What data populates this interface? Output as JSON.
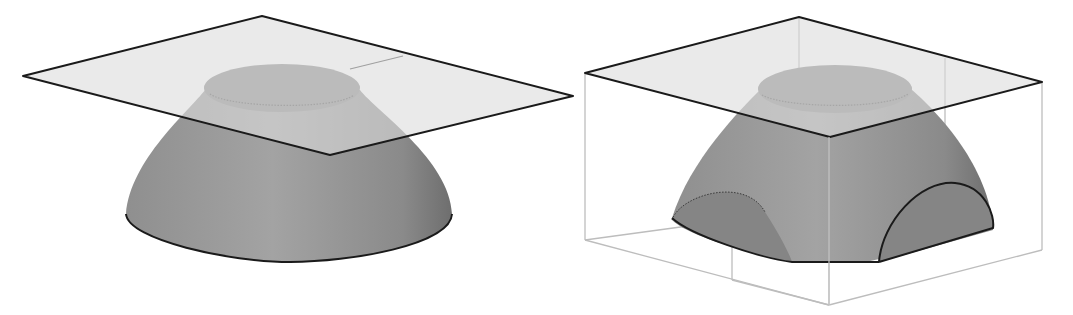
{
  "figure": {
    "panels": [
      {
        "id": "left",
        "subject": "Truncated dome with flat top cut by a translucent horizontal plane"
      },
      {
        "id": "right",
        "subject": "Truncated dome inside a bounding box, cut by a horizontal plane, with two semicircular side cuts"
      }
    ],
    "colors": {
      "background": "#ffffff",
      "solid_fill": "#9a9a9a",
      "solid_dark": "#7e7e7e",
      "cap_fill": "#858585",
      "plane_fill": "#d6d6d6",
      "edge_dark": "#1a1a1a",
      "box_edge": "#bdbdbd"
    }
  }
}
